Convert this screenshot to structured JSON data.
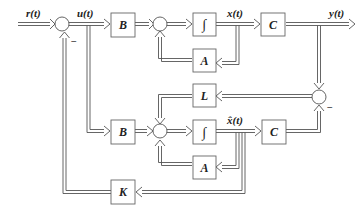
{
  "diagram": {
    "type": "control-system-block-diagram",
    "signals": {
      "reference": "r(t)",
      "control": "u(t)",
      "state": "x(t)",
      "output": "y(t)",
      "estimated_state": "x̂(t)"
    },
    "blocks": {
      "b_plant": "B",
      "integrator_plant": "∫",
      "c_plant": "C",
      "a_plant": "A",
      "l_gain": "L",
      "b_observer": "B",
      "integrator_observer": "∫",
      "c_observer": "C",
      "a_observer": "A",
      "k_gain": "K"
    },
    "signs": {
      "summer_input_feedback": "−",
      "summer_error_feedback": "−"
    },
    "colors": {
      "line": "#555555",
      "block_border": "#666666",
      "background": "#ffffff"
    }
  }
}
